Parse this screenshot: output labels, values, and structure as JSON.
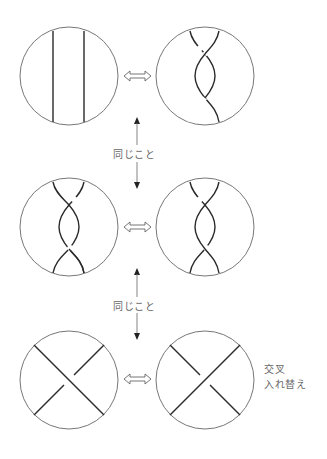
{
  "labels": {
    "same_1": "同じこと",
    "same_2": "同じこと",
    "swap_line1": "交叉",
    "swap_line2": "入れ替え"
  },
  "rows": [
    {
      "left": "two parallel vertical strands",
      "right": "two strands with two crossings (twist)",
      "relation": "⇔"
    },
    {
      "left": "two crossings, opposite twist",
      "right": "two crossings, twist",
      "relation": "⇔"
    },
    {
      "left": "single crossing, upper-left to lower-right over",
      "right": "single crossing, upper-right to lower-left over",
      "relation": "⇔"
    }
  ],
  "colors": {
    "stroke": "#2a2a2a",
    "circle": "#777777",
    "text": "#666666"
  }
}
